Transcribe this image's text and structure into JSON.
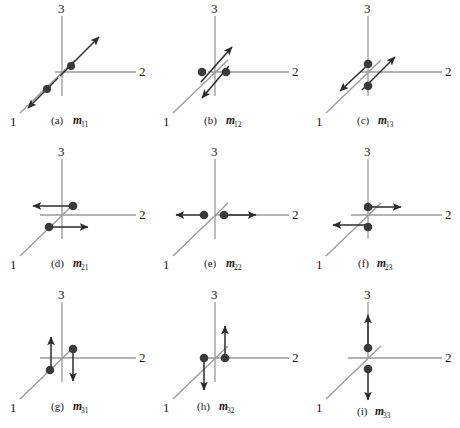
{
  "figure": {
    "axis_color": "#9a9a9a",
    "vector_color": "#2b2b2b",
    "dot_color": "#3a3a3a",
    "background": "#ffffff",
    "axis_labels": {
      "a1": "1",
      "a2": "2",
      "a3": "3"
    },
    "panels": [
      {
        "id": "a",
        "index_label": "(a)",
        "symbol": "m",
        "subscript": "11",
        "description": "double force along axis 1, arrows up-right and down-left on the 1-axis"
      },
      {
        "id": "b",
        "index_label": "(b)",
        "symbol": "m",
        "subscript": "12",
        "description": "couple: two arrows parallel to axis 1, offset along axis 2"
      },
      {
        "id": "c",
        "index_label": "(c)",
        "symbol": "m",
        "subscript": "13",
        "description": "couple: two arrows parallel to axis 1, offset along axis 3"
      },
      {
        "id": "d",
        "index_label": "(d)",
        "symbol": "m",
        "subscript": "21",
        "description": "couple: two horizontal arrows along axis 2, offset along axis 1"
      },
      {
        "id": "e",
        "index_label": "(e)",
        "symbol": "m",
        "subscript": "22",
        "description": "double force along axis 2, arrows left and right"
      },
      {
        "id": "f",
        "index_label": "(f)",
        "symbol": "m",
        "subscript": "23",
        "description": "couple: two horizontal arrows along axis 2, offset along axis 3"
      },
      {
        "id": "g",
        "index_label": "(g)",
        "symbol": "m",
        "subscript": "31",
        "description": "couple: two vertical arrows along axis 3, offset along axis 1"
      },
      {
        "id": "h",
        "index_label": "(h)",
        "symbol": "m",
        "subscript": "32",
        "description": "couple: two vertical arrows along axis 3, offset along axis 2"
      },
      {
        "id": "i",
        "index_label": "(i)",
        "symbol": "m",
        "subscript": "33",
        "description": "double force along axis 3, arrows up and down"
      }
    ]
  }
}
